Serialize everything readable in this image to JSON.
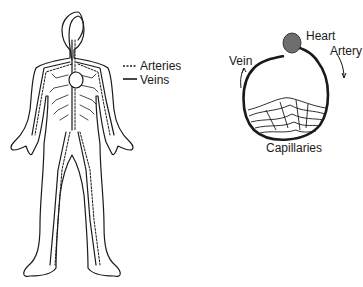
{
  "legend": {
    "arteries": {
      "label": "Arteries",
      "style": "dashed"
    },
    "veins": {
      "label": "Veins",
      "style": "solid"
    }
  },
  "loop_diagram": {
    "heart_label": "Heart",
    "artery_label": "Artery",
    "vein_label": "Vein",
    "capillaries_label": "Capillaries"
  },
  "colors": {
    "ink": "#1a1a1a",
    "background": "#ffffff",
    "heart_fill": "#777777"
  }
}
